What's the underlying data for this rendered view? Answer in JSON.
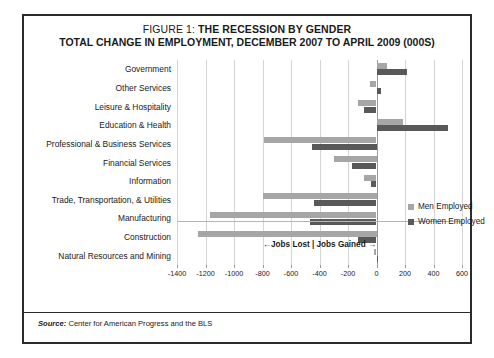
{
  "figure": {
    "title_prefix": "FIGURE 1:",
    "title_main": "THE RECESSION BY GENDER",
    "subtitle": "TOTAL CHANGE IN EMPLOYMENT, DECEMBER 2007 TO APRIL 2009 (000S)",
    "source_label": "Source:",
    "source_text": "Center for American Progress and the BLS"
  },
  "legend": {
    "position": "inside-right",
    "items": [
      {
        "label": "Men Employed",
        "color": "#a6a6a6"
      },
      {
        "label": "Women Employed",
        "color": "#595959"
      }
    ]
  },
  "chart_data": {
    "type": "bar",
    "orientation": "horizontal",
    "xlabel": "←Jobs Lost | Jobs Gained →",
    "ylabel": "",
    "xlim": [
      -1400,
      600
    ],
    "xticks": [
      -1400,
      -1200,
      -1000,
      -800,
      -600,
      -400,
      -200,
      0,
      200,
      400,
      600
    ],
    "xtick_labels": [
      "-1400",
      "-1200",
      "-1000",
      "-800",
      "-600",
      "-400",
      "-200",
      "0",
      "200",
      "400",
      "600"
    ],
    "grid": "vertical",
    "categories": [
      "Government",
      "Other Services",
      "Leisure & Hospitality",
      "Education & Health",
      "Professional & Business Services",
      "Financial Services",
      "Information",
      "Trade, Transportation, & Utilities",
      "Manufacturing",
      "Construction",
      "Natural Resources and Mining"
    ],
    "series": [
      {
        "name": "Men Employed",
        "color": "#a6a6a6",
        "values": [
          75,
          -45,
          -130,
          185,
          -790,
          -300,
          -90,
          -800,
          -1170,
          -1250,
          -15
        ]
      },
      {
        "name": "Women Employed",
        "color": "#595959",
        "values": [
          215,
          30,
          -90,
          500,
          -450,
          -170,
          -40,
          -440,
          -470,
          -130,
          10
        ]
      }
    ]
  }
}
